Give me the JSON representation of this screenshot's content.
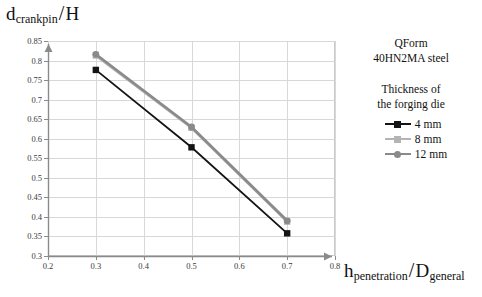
{
  "chart_data": {
    "type": "line",
    "title": "",
    "xlabel": "h penetration / D general",
    "ylabel": "d crankpin / H",
    "xlim": [
      0.2,
      0.8
    ],
    "ylim": [
      0.3,
      0.85
    ],
    "xticks": [
      "0.2",
      "0.3",
      "0.4",
      "0.5",
      "0.6",
      "0.7",
      "0.8"
    ],
    "yticks": [
      "0.3",
      "0.35",
      "0.4",
      "0.45",
      "0.5",
      "0.55",
      "0.6",
      "0.65",
      "0.7",
      "0.75",
      "0.8",
      "0.85"
    ],
    "grid": true,
    "legend_position": "right",
    "x": [
      0.3,
      0.5,
      0.7
    ],
    "series": [
      {
        "name": "4 mm",
        "values": [
          0.776,
          0.578,
          0.358
        ],
        "color": "#141414",
        "marker": "square"
      },
      {
        "name": "8 mm",
        "values": [
          0.813,
          0.628,
          0.388
        ],
        "color": "#b4b4b4",
        "marker": "square"
      },
      {
        "name": "12 mm",
        "values": [
          0.816,
          0.63,
          0.39
        ],
        "color": "#8a8a8a",
        "marker": "circle"
      }
    ]
  },
  "axis_titles": {
    "y_main": "d",
    "y_sub": "crankpin",
    "y_den": "H",
    "x_main": "h",
    "x_sub": "penetration",
    "x_den": "D",
    "x_den_sub": "general",
    "slash": "/"
  },
  "annotation": {
    "software": "QForm",
    "material": "40HN2MA steel",
    "legend_title_line1": "Thickness of",
    "legend_title_line2": "the forging die"
  },
  "legend": {
    "items": [
      {
        "label": "4 mm",
        "color": "#141414",
        "marker": "square"
      },
      {
        "label": "8 mm",
        "color": "#b4b4b4",
        "marker": "square"
      },
      {
        "label": "12 mm",
        "color": "#8a8a8a",
        "marker": "circle"
      }
    ]
  }
}
